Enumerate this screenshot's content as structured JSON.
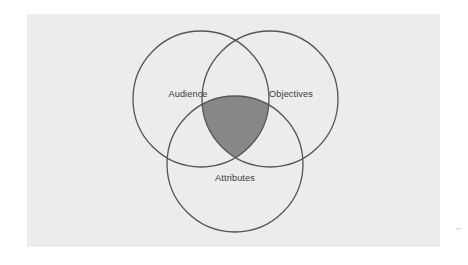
{
  "figure": {
    "kind": "venn-diagram",
    "set_count": 3,
    "panel": {
      "background_color": "#ececec",
      "page_background_color": "#ffffff",
      "x": 27,
      "y": 14,
      "width": 413,
      "height": 233
    },
    "style": {
      "circle_stroke_color": "#555555",
      "circle_stroke_width": 1.3,
      "circle_fill": "none",
      "center_intersection_fill": "#878787",
      "label_color": "#3a3a3a",
      "label_font_size": 9.2
    },
    "geometry": {
      "radius": 68,
      "note": "three equal circles in symmetric triple-overlap arrangement"
    },
    "circles": [
      {
        "id": "audience",
        "label": "Audience",
        "cx": 201,
        "cy": 99,
        "r": 68,
        "label_x": 188,
        "label_y": 95
      },
      {
        "id": "objectives",
        "label": "Objectives",
        "cx": 270,
        "cy": 99,
        "r": 68,
        "label_x": 291,
        "label_y": 95
      },
      {
        "id": "attributes",
        "label": "Attributes",
        "cx": 235,
        "cy": 164,
        "r": 68,
        "label_x": 235,
        "label_y": 179
      }
    ],
    "center_region": {
      "id": "center-intersection",
      "label": "",
      "fill": "#878787",
      "description": "shaded triple-overlap region"
    },
    "artifact_mark": {
      "x": 456,
      "y": 228,
      "color": "#d8d8d8"
    }
  }
}
